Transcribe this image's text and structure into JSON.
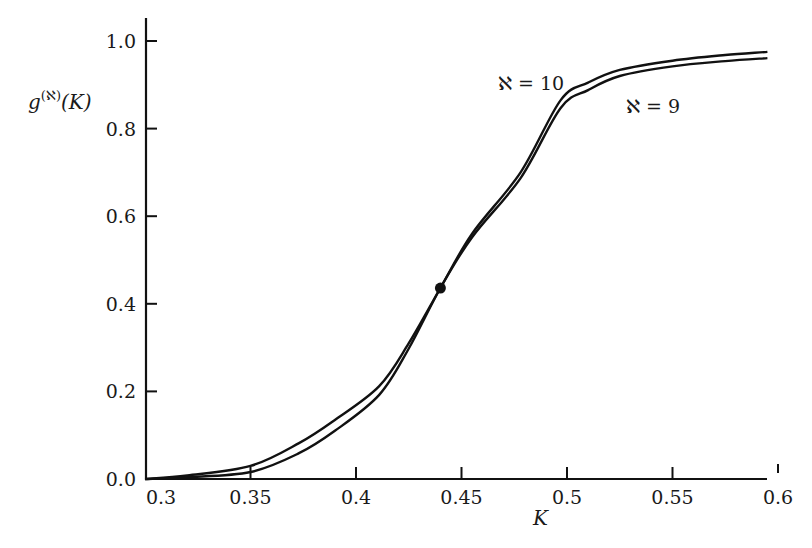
{
  "chart_data": {
    "type": "line",
    "title": "",
    "xlabel": "K",
    "ylabel": "g^(ℵ)(K)",
    "ylabel_parts": {
      "base": "g",
      "sup": "(ℵ)",
      "arg": "(K)"
    },
    "xlim": [
      0.3,
      0.6
    ],
    "ylim": [
      0.0,
      1.0
    ],
    "grid": false,
    "legend": "inline labels",
    "x_ticks": [
      0.3,
      0.35,
      0.4,
      0.45,
      0.5,
      0.55,
      0.6
    ],
    "x_tick_labels": [
      "0.3",
      "0.35",
      "0.4",
      "0.45",
      "0.5",
      "0.55",
      "0.6"
    ],
    "y_ticks": [
      0.0,
      0.2,
      0.4,
      0.6,
      0.8,
      1.0
    ],
    "y_tick_labels": [
      "0.0",
      "0.2",
      "0.4",
      "0.6",
      "0.8",
      "1.0"
    ],
    "series": [
      {
        "name": "ℵ = 10",
        "label": "ℵ = 10",
        "x": [
          0.3,
          0.32,
          0.35,
          0.373,
          0.39,
          0.411,
          0.425,
          0.44,
          0.455,
          0.478,
          0.497,
          0.51,
          0.525,
          0.55,
          0.575,
          0.595
        ],
        "values": [
          0.0,
          0.008,
          0.03,
          0.082,
          0.135,
          0.212,
          0.31,
          0.436,
          0.56,
          0.7,
          0.865,
          0.905,
          0.934,
          0.955,
          0.968,
          0.975
        ]
      },
      {
        "name": "ℵ = 9",
        "label": "ℵ = 9",
        "x": [
          0.3,
          0.32,
          0.35,
          0.373,
          0.39,
          0.411,
          0.425,
          0.44,
          0.455,
          0.478,
          0.497,
          0.51,
          0.525,
          0.55,
          0.575,
          0.595
        ],
        "values": [
          0.0,
          0.004,
          0.016,
          0.059,
          0.11,
          0.192,
          0.298,
          0.436,
          0.552,
          0.687,
          0.847,
          0.888,
          0.92,
          0.942,
          0.954,
          0.961
        ]
      }
    ],
    "annotations": [
      {
        "type": "point",
        "x": 0.44,
        "y": 0.436,
        "description": "crossing point of the two curves"
      }
    ]
  },
  "labels": {
    "ylabel_base": "g",
    "ylabel_sup": "(ℵ)",
    "ylabel_arg": "(K)",
    "xlabel": "K",
    "series_10": "ℵ = 10",
    "series_9": "ℵ = 9"
  }
}
